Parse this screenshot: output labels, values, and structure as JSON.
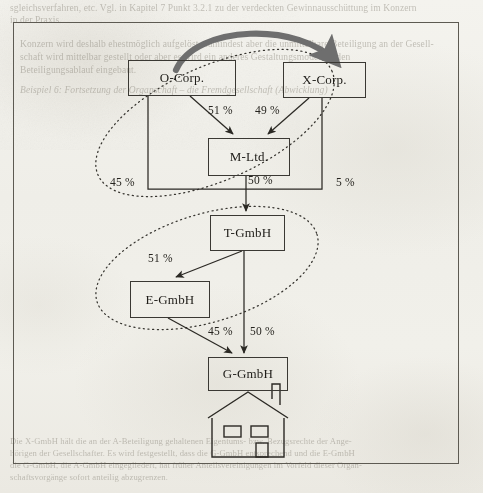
{
  "page": {
    "background_color": "#f2f1ec",
    "frame_border_color": "#5d5a52"
  },
  "bleed_text": {
    "top": [
      "sgleichsverfahren, etc. Vgl. in Kapitel 7 Punkt 3.2.1 zu der verdeckten Gewinnausschüttung im Konzern",
      "in der Praxis.",
      "Konzern wird deshalb ehestmöglich aufgelöst, zumindest aber die unmittelbare Beteiligung an der Gesell-",
      "schaft wird mittelbar gestellt oder aber es wird ein anderes Gestaltungsmodell in den",
      "Beteiligungsablauf eingebaut.",
      "Beispiel 6: Fortsetzung der Organschaft – die Fremdgesellschaft (Abwicklung)"
    ],
    "bottom": [
      "Die X-GmbH hält die an der A-Beteiligung gehaltenen Eigentums- bzw. Bezugsrechte der Ange-",
      "hörigen der Gesellschafter. Es wird festgestellt, dass die G-GmbH entsprechend und die E-GmbH",
      "die G-GmbH, die A-GmbH eingegliedert, hat früher Anteilsvereinigungen im Vorfeld dieser Organ-",
      "schaftsvorgänge sofort anteilig abzugrenzen."
    ]
  },
  "diagram": {
    "type": "corporate-shareholding-diagram",
    "nodes": [
      {
        "id": "o-corp",
        "label": "O-Corp.",
        "x": 128,
        "y": 60,
        "w": 108,
        "h": 36
      },
      {
        "id": "x-corp",
        "label": "X-Corp.",
        "x": 283,
        "y": 62,
        "w": 83,
        "h": 36
      },
      {
        "id": "m-ltd",
        "label": "M-Ltd.",
        "x": 208,
        "y": 138,
        "w": 82,
        "h": 38
      },
      {
        "id": "t-gmbh",
        "label": "T-GmbH",
        "x": 210,
        "y": 215,
        "w": 75,
        "h": 36
      },
      {
        "id": "e-gmbh",
        "label": "E-GmbH",
        "x": 130,
        "y": 281,
        "w": 80,
        "h": 37
      },
      {
        "id": "g-gmbh",
        "label": "G-GmbH",
        "x": 208,
        "y": 357,
        "w": 80,
        "h": 34
      }
    ],
    "edges": [
      {
        "from": "o-corp",
        "to": "m-ltd",
        "label": "51 %",
        "lx": 208,
        "ly": 110
      },
      {
        "from": "x-corp",
        "to": "m-ltd",
        "label": "49 %",
        "lx": 255,
        "ly": 110
      },
      {
        "from": "o-corp",
        "to": "t-gmbh",
        "label": "45 %",
        "lx": 110,
        "ly": 181
      },
      {
        "from": "m-ltd",
        "to": "t-gmbh",
        "label": "50 %",
        "lx": 246,
        "ly": 179
      },
      {
        "from": "x-corp",
        "to": "t-gmbh",
        "label": "5 %",
        "lx": 334,
        "ly": 181
      },
      {
        "from": "t-gmbh",
        "to": "e-gmbh",
        "label": "51 %",
        "lx": 151,
        "ly": 259
      },
      {
        "from": "e-gmbh",
        "to": "g-gmbh",
        "label": "45 %",
        "lx": 209,
        "ly": 330
      },
      {
        "from": "t-gmbh",
        "to": "g-gmbh",
        "label": "50 %",
        "lx": 248,
        "ly": 330
      }
    ],
    "groupings": [
      {
        "id": "upper-group",
        "style": "dotted-ellipse",
        "members": [
          "o-corp",
          "m-ltd"
        ]
      },
      {
        "id": "lower-group",
        "style": "dotted-ellipse",
        "members": [
          "t-gmbh",
          "e-gmbh"
        ]
      }
    ],
    "highlight_arrow": {
      "id": "transfer-arrow",
      "style": "thick-curved-gray",
      "color": "#6e6e6e",
      "from": "o-corp",
      "to": "x-corp"
    },
    "house_symbol": {
      "id": "house-icon",
      "below": "g-gmbh"
    }
  }
}
